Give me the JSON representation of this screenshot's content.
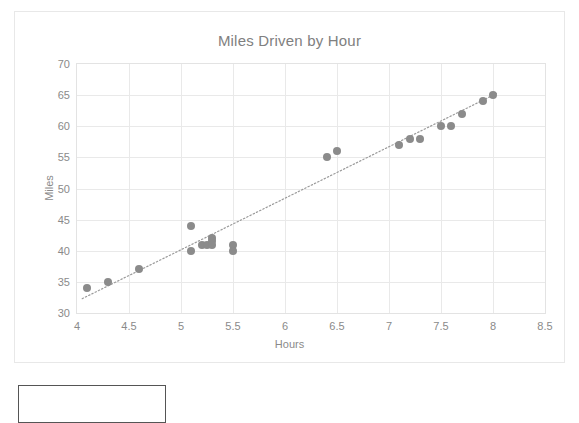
{
  "chart_data": {
    "type": "scatter",
    "title": "Miles Driven by Hour",
    "xlabel": "Hours",
    "ylabel": "Miles",
    "xlim": [
      4,
      8.5
    ],
    "ylim": [
      30,
      70
    ],
    "xticks": [
      "4",
      "4.5",
      "5",
      "5.5",
      "6",
      "6.5",
      "7",
      "7.5",
      "8",
      "8.5"
    ],
    "xtick_values": [
      4,
      4.5,
      5,
      5.5,
      6,
      6.5,
      7,
      7.5,
      8,
      8.5
    ],
    "yticks": [
      "30",
      "35",
      "40",
      "45",
      "50",
      "55",
      "60",
      "65",
      "70"
    ],
    "ytick_values": [
      30,
      35,
      40,
      45,
      50,
      55,
      60,
      65,
      70
    ],
    "grid": true,
    "legend": "none",
    "series": [
      {
        "name": "Miles Driven",
        "marker_color": "#8b8b8b",
        "points": [
          {
            "x": 4.1,
            "y": 34
          },
          {
            "x": 4.3,
            "y": 35
          },
          {
            "x": 4.6,
            "y": 37
          },
          {
            "x": 5.1,
            "y": 44
          },
          {
            "x": 5.1,
            "y": 40
          },
          {
            "x": 5.2,
            "y": 41
          },
          {
            "x": 5.25,
            "y": 41
          },
          {
            "x": 5.3,
            "y": 42
          },
          {
            "x": 5.3,
            "y": 41.5
          },
          {
            "x": 5.3,
            "y": 41
          },
          {
            "x": 5.5,
            "y": 41
          },
          {
            "x": 5.5,
            "y": 40
          },
          {
            "x": 6.4,
            "y": 55
          },
          {
            "x": 6.5,
            "y": 56
          },
          {
            "x": 7.1,
            "y": 57
          },
          {
            "x": 7.2,
            "y": 58
          },
          {
            "x": 7.3,
            "y": 58
          },
          {
            "x": 7.5,
            "y": 60
          },
          {
            "x": 7.6,
            "y": 60
          },
          {
            "x": 7.7,
            "y": 62
          },
          {
            "x": 7.9,
            "y": 64
          },
          {
            "x": 8.0,
            "y": 65
          }
        ]
      }
    ],
    "trendline": {
      "style": "dotted",
      "color": "#9a9a9a",
      "x0": 4.05,
      "y0": 32.3,
      "x1": 8.05,
      "y1": 65.4
    }
  },
  "annotations": {
    "bottom_box_label": ""
  }
}
